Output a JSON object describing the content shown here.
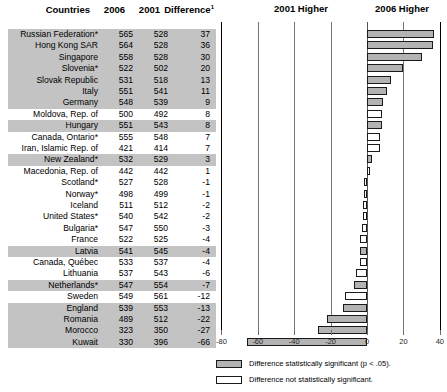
{
  "table": {
    "headers": {
      "countries": "Countries",
      "y2006": "2006",
      "y2001": "2001",
      "difference": "Difference",
      "difference_superscript": "1"
    }
  },
  "plot": {
    "left_label": "2001 Higher",
    "right_label": "2006 Higher"
  },
  "legend": {
    "significant": "Difference statistically significant (p < .05).",
    "not_significant": "Difference not statistically significant."
  },
  "colors": {
    "bar_significant": "#b3b3b3",
    "bar_not_significant": "#ffffff",
    "bar_border": "#1a1a1a",
    "row_shaded": "#c3c3c3",
    "gridline": "#757575",
    "text": "#000000"
  },
  "chart_data": {
    "type": "bar",
    "orientation": "horizontal",
    "title": "",
    "xlabel": "",
    "ylabel": "",
    "xlim": [
      -80,
      40
    ],
    "xticks": [
      -80,
      -60,
      -40,
      -20,
      0,
      20,
      40
    ],
    "xticklabels": [
      "-80",
      "-60",
      "-40",
      "-20",
      "0",
      "20",
      "40"
    ],
    "grid": true,
    "legend_position": "bottom",
    "zero_reference": 0,
    "categories": [
      "Russian Federation*",
      "Hong Kong SAR",
      "Singapore",
      "Slovenia*",
      "Slovak Republic",
      "Italy",
      "Germany",
      "Moldova, Rep. of",
      "Hungary",
      "Canada, Ontario*",
      "Iran, Islamic Rep. of",
      "New Zealand*",
      "Macedonia, Rep. of",
      "Scotland*",
      "Norway*",
      "Iceland",
      "United States*",
      "Bulgaria*",
      "France",
      "Latvia",
      "Canada, Québec",
      "Lithuania",
      "Netherlands*",
      "Sweden",
      "England",
      "Romania",
      "Morocco",
      "Kuwait"
    ],
    "values": [
      37,
      36,
      30,
      20,
      13,
      11,
      9,
      8,
      8,
      7,
      7,
      3,
      1,
      -1,
      -1,
      -2,
      -2,
      -3,
      -4,
      -4,
      -4,
      -6,
      -7,
      -12,
      -13,
      -22,
      -27,
      -66
    ],
    "series": [
      {
        "name": "2006",
        "values": [
          565,
          564,
          558,
          522,
          531,
          551,
          548,
          500,
          551,
          555,
          421,
          532,
          442,
          527,
          498,
          511,
          540,
          547,
          522,
          541,
          533,
          537,
          547,
          549,
          539,
          489,
          323,
          330
        ]
      },
      {
        "name": "2001",
        "values": [
          528,
          528,
          528,
          502,
          518,
          541,
          539,
          492,
          543,
          548,
          414,
          529,
          442,
          528,
          499,
          512,
          542,
          550,
          525,
          545,
          537,
          543,
          554,
          561,
          553,
          512,
          350,
          396
        ]
      }
    ],
    "significant": [
      true,
      true,
      true,
      true,
      true,
      true,
      true,
      false,
      true,
      false,
      false,
      true,
      false,
      false,
      false,
      false,
      false,
      false,
      false,
      true,
      false,
      false,
      true,
      false,
      true,
      true,
      true,
      true
    ],
    "rows": [
      {
        "country": "Russian Federation*",
        "y2006": "565",
        "y2001": "528",
        "difference": "37",
        "value": 37,
        "significant": true
      },
      {
        "country": "Hong Kong SAR",
        "y2006": "564",
        "y2001": "528",
        "difference": "36",
        "value": 36,
        "significant": true
      },
      {
        "country": "Singapore",
        "y2006": "558",
        "y2001": "528",
        "difference": "30",
        "value": 30,
        "significant": true
      },
      {
        "country": "Slovenia*",
        "y2006": "522",
        "y2001": "502",
        "difference": "20",
        "value": 20,
        "significant": true
      },
      {
        "country": "Slovak Republic",
        "y2006": "531",
        "y2001": "518",
        "difference": "13",
        "value": 13,
        "significant": true
      },
      {
        "country": "Italy",
        "y2006": "551",
        "y2001": "541",
        "difference": "11",
        "value": 11,
        "significant": true
      },
      {
        "country": "Germany",
        "y2006": "548",
        "y2001": "539",
        "difference": "9",
        "value": 9,
        "significant": true
      },
      {
        "country": "Moldova, Rep. of",
        "y2006": "500",
        "y2001": "492",
        "difference": "8",
        "value": 8,
        "significant": false
      },
      {
        "country": "Hungary",
        "y2006": "551",
        "y2001": "543",
        "difference": "8",
        "value": 8,
        "significant": true
      },
      {
        "country": "Canada, Ontario*",
        "y2006": "555",
        "y2001": "548",
        "difference": "7",
        "value": 7,
        "significant": false
      },
      {
        "country": "Iran, Islamic Rep. of",
        "y2006": "421",
        "y2001": "414",
        "difference": "7",
        "value": 7,
        "significant": false
      },
      {
        "country": "New Zealand*",
        "y2006": "532",
        "y2001": "529",
        "difference": "3",
        "value": 3,
        "significant": true
      },
      {
        "country": "Macedonia, Rep. of",
        "y2006": "442",
        "y2001": "442",
        "difference": "1",
        "value": 1,
        "significant": false
      },
      {
        "country": "Scotland*",
        "y2006": "527",
        "y2001": "528",
        "difference": "-1",
        "value": -1,
        "significant": false
      },
      {
        "country": "Norway*",
        "y2006": "498",
        "y2001": "499",
        "difference": "-1",
        "value": -1,
        "significant": false
      },
      {
        "country": "Iceland",
        "y2006": "511",
        "y2001": "512",
        "difference": "-2",
        "value": -2,
        "significant": false
      },
      {
        "country": "United States*",
        "y2006": "540",
        "y2001": "542",
        "difference": "-2",
        "value": -2,
        "significant": false
      },
      {
        "country": "Bulgaria*",
        "y2006": "547",
        "y2001": "550",
        "difference": "-3",
        "value": -3,
        "significant": false
      },
      {
        "country": "France",
        "y2006": "522",
        "y2001": "525",
        "difference": "-4",
        "value": -4,
        "significant": false
      },
      {
        "country": "Latvia",
        "y2006": "541",
        "y2001": "545",
        "difference": "-4",
        "value": -4,
        "significant": true
      },
      {
        "country": "Canada, Québec",
        "y2006": "533",
        "y2001": "537",
        "difference": "-4",
        "value": -4,
        "significant": false
      },
      {
        "country": "Lithuania",
        "y2006": "537",
        "y2001": "543",
        "difference": "-6",
        "value": -6,
        "significant": false
      },
      {
        "country": "Netherlands*",
        "y2006": "547",
        "y2001": "554",
        "difference": "-7",
        "value": -7,
        "significant": true
      },
      {
        "country": "Sweden",
        "y2006": "549",
        "y2001": "561",
        "difference": "-12",
        "value": -12,
        "significant": false
      },
      {
        "country": "England",
        "y2006": "539",
        "y2001": "553",
        "difference": "-13",
        "value": -13,
        "significant": true
      },
      {
        "country": "Romania",
        "y2006": "489",
        "y2001": "512",
        "difference": "-22",
        "value": -22,
        "significant": true
      },
      {
        "country": "Morocco",
        "y2006": "323",
        "y2001": "350",
        "difference": "-27",
        "value": -27,
        "significant": true
      },
      {
        "country": "Kuwait",
        "y2006": "330",
        "y2001": "396",
        "difference": "-66",
        "value": -66,
        "significant": true
      }
    ]
  }
}
